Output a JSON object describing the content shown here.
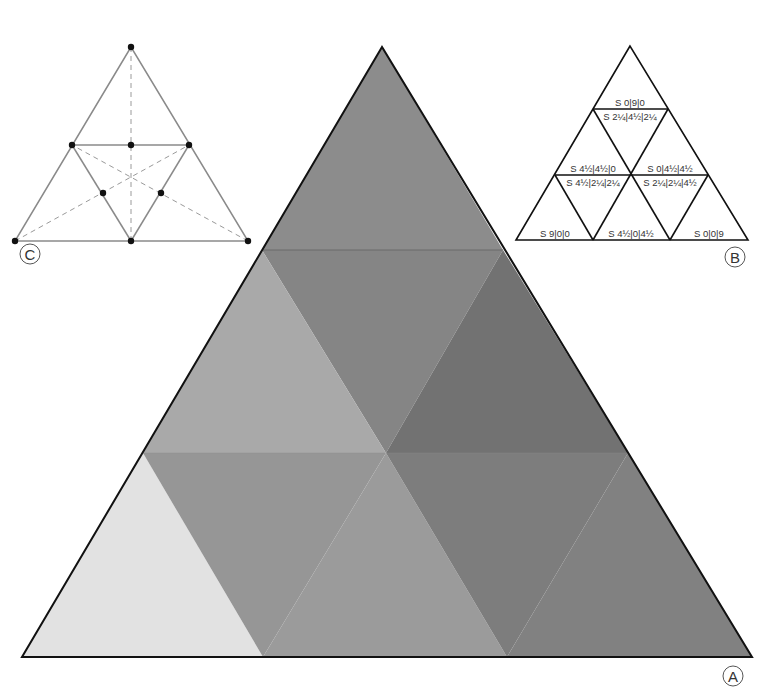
{
  "figure": {
    "panels": {
      "A": {
        "label": "A",
        "description": "Large triangle subdivided into nine shaded sub-triangles (grey tones)"
      },
      "B": {
        "label": "B",
        "cells": [
          {
            "text": "S 0|9|0"
          },
          {
            "text": "S 2¼|4½|2¼"
          },
          {
            "text": "S 4½|4½|0"
          },
          {
            "text": "S 0|4½|4½"
          },
          {
            "text": "S 4½|2¼|2¼"
          },
          {
            "text": "S 2¼|2¼|4½"
          },
          {
            "text": "S 9|0|0"
          },
          {
            "text": "S 4½|0|4½"
          },
          {
            "text": "S 0|0|9"
          }
        ]
      },
      "C": {
        "label": "C",
        "description": "Triangle with midpoint subdivisions and dashed medians"
      }
    },
    "colors": {
      "top": "#8c8c8c",
      "upper_center": "#858585",
      "upper_left": "#a9a9a9",
      "upper_right": "#727272",
      "lower_left_corner": "#e2e2e2",
      "lower_inv_left": "#969696",
      "lower_center": "#9b9b9b",
      "lower_inv_right": "#7d7d7d",
      "lower_right_corner": "#818181",
      "outline": "#111111",
      "diagram_c_line": "#888888"
    }
  }
}
